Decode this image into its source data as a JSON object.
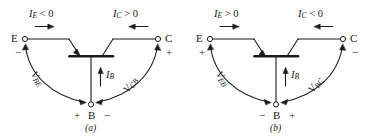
{
  "figure": {
    "panels": [
      {
        "id": "a",
        "caption": "(a)",
        "emitter": {
          "terminal_label": "E",
          "polarity_sign": "−"
        },
        "collector": {
          "terminal_label": "C",
          "polarity_sign": "+"
        },
        "base": {
          "terminal_label": "B",
          "left_sign": "+",
          "right_sign": "−"
        },
        "emitter_current": {
          "symbol": "I",
          "subscript": "E",
          "relation": "<",
          "value": "0",
          "arrow_direction": "right"
        },
        "collector_current": {
          "symbol": "I",
          "subscript": "C",
          "relation": ">",
          "value": "0",
          "arrow_direction": "left"
        },
        "base_current": {
          "symbol": "I",
          "subscript": "B",
          "arrow_direction": "up"
        },
        "left_voltage": {
          "symbol": "V",
          "subscript": "BE"
        },
        "right_voltage": {
          "symbol": "V",
          "subscript": "CB"
        }
      },
      {
        "id": "b",
        "caption": "(b)",
        "emitter": {
          "terminal_label": "E",
          "polarity_sign": "+"
        },
        "collector": {
          "terminal_label": "C",
          "polarity_sign": "−"
        },
        "base": {
          "terminal_label": "B",
          "left_sign": "−",
          "right_sign": "+"
        },
        "emitter_current": {
          "symbol": "I",
          "subscript": "E",
          "relation": ">",
          "value": "0",
          "arrow_direction": "right"
        },
        "collector_current": {
          "symbol": "I",
          "subscript": "C",
          "relation": "<",
          "value": "0",
          "arrow_direction": "left"
        },
        "base_current": {
          "symbol": "I",
          "subscript": "B",
          "arrow_direction": "up"
        },
        "left_voltage": {
          "symbol": "V",
          "subscript": "EB"
        },
        "right_voltage": {
          "symbol": "V",
          "subscript": "BC"
        }
      }
    ],
    "colors": {
      "ink": "#1a1a1a",
      "background": "#ffffff"
    }
  }
}
